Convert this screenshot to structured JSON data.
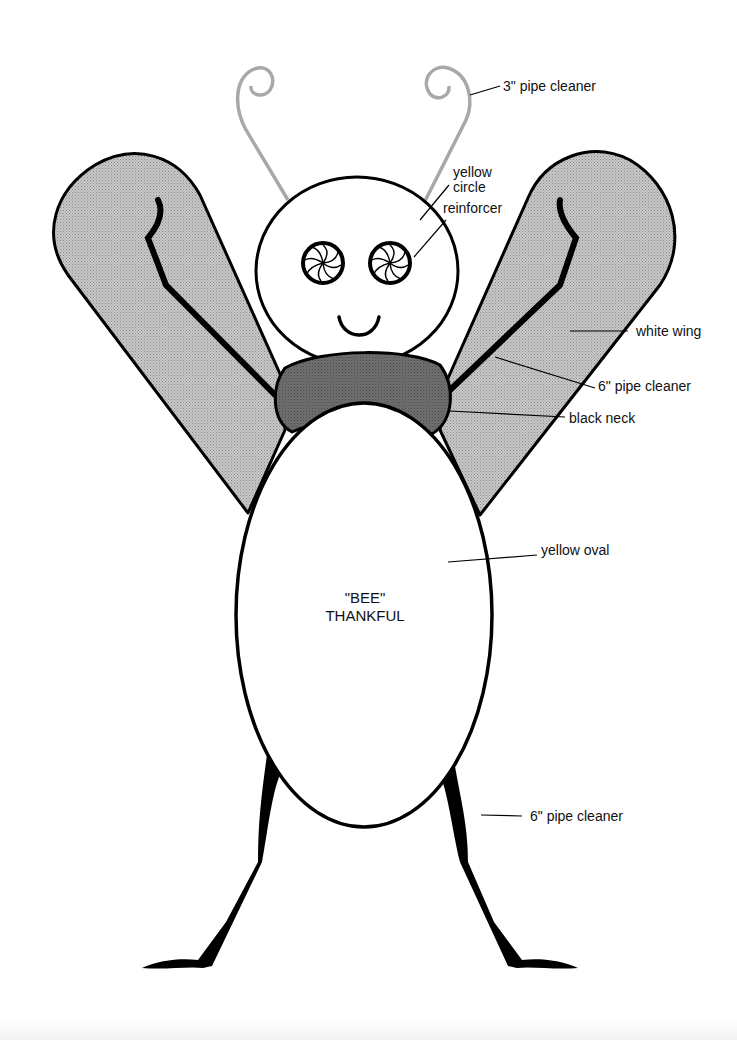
{
  "diagram": {
    "center_text": {
      "line1": "\"BEE\"",
      "line2": "THANKFUL"
    },
    "labels": {
      "antenna": "3\" pipe cleaner",
      "eye_line1": "yellow",
      "eye_line2": "circle",
      "eye_line3": "reinforcer",
      "wing": "white wing",
      "wing_vein": "6\" pipe cleaner",
      "neck": "black neck",
      "body": "yellow oval",
      "legs": "6\" pipe cleaner"
    },
    "parts": [
      {
        "name": "antennae",
        "material": "3\" pipe cleaner"
      },
      {
        "name": "head",
        "shape": "circle"
      },
      {
        "name": "eyes",
        "material": "yellow circle reinforcer"
      },
      {
        "name": "wings",
        "material": "white wing"
      },
      {
        "name": "wing veins",
        "material": "6\" pipe cleaner"
      },
      {
        "name": "neck",
        "material": "black neck"
      },
      {
        "name": "body",
        "material": "yellow oval"
      },
      {
        "name": "legs",
        "material": "6\" pipe cleaner"
      }
    ],
    "colors": {
      "outline": "#000000",
      "wing_fill": "#bdbdbd",
      "neck_fill": "#6e6e6e",
      "antenna_stroke": "#a8a8a8",
      "background": "#ffffff"
    }
  }
}
